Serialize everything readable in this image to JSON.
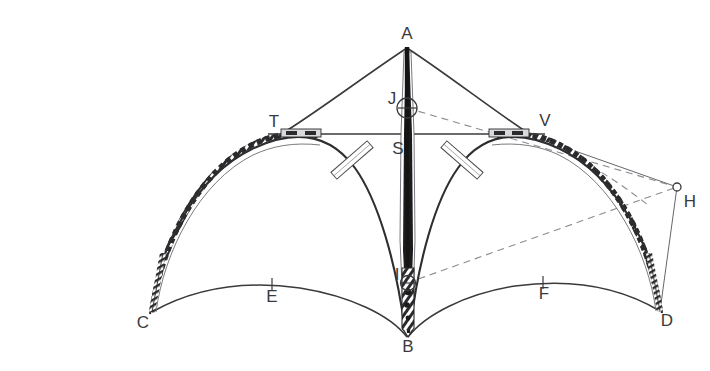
{
  "caption": {
    "number": "113",
    "text": "Lucy Edward's Black Bird construction diagram"
  },
  "figure": {
    "title": "Black Bird construction diagram",
    "colors": {
      "ink": "#3a3a3c",
      "mast": "#1c1c1c",
      "thin": "#55555a",
      "dashed": "#7c7c82",
      "background": "#ffffff"
    },
    "labels": [
      {
        "id": "A",
        "text": "A",
        "x": 407,
        "y": 39,
        "anchor": "middle",
        "note": "apex of mast"
      },
      {
        "id": "J",
        "text": "J",
        "x": 392,
        "y": 104,
        "anchor": "middle",
        "note": "upper node ring"
      },
      {
        "id": "T",
        "text": "T",
        "x": 274,
        "y": 127,
        "anchor": "middle",
        "note": "left spreader end"
      },
      {
        "id": "V",
        "text": "V",
        "x": 545,
        "y": 126,
        "anchor": "middle",
        "note": "right spreader end"
      },
      {
        "id": "S",
        "text": "S",
        "x": 398,
        "y": 154,
        "anchor": "middle",
        "note": "mast / spreader crossing"
      },
      {
        "id": "H",
        "text": "H",
        "x": 690,
        "y": 207,
        "anchor": "middle",
        "note": "anchor point right"
      },
      {
        "id": "I",
        "text": "I",
        "x": 397,
        "y": 280,
        "anchor": "middle",
        "note": "lower node ring"
      },
      {
        "id": "E",
        "text": "E",
        "x": 272,
        "y": 302,
        "anchor": "middle",
        "note": "left lower arc tick"
      },
      {
        "id": "F",
        "text": "F",
        "x": 544,
        "y": 299,
        "anchor": "middle",
        "note": "right lower arc tick"
      },
      {
        "id": "C",
        "text": "C",
        "x": 143,
        "y": 328,
        "anchor": "middle",
        "note": "left ground point"
      },
      {
        "id": "D",
        "text": "D",
        "x": 667,
        "y": 326,
        "anchor": "middle",
        "note": "right ground point"
      },
      {
        "id": "B",
        "text": "B",
        "x": 408,
        "y": 352,
        "anchor": "middle",
        "note": "mast foot"
      }
    ],
    "points": {
      "A": [
        407,
        47
      ],
      "J": [
        407,
        108
      ],
      "T": [
        282,
        134
      ],
      "V": [
        527,
        134
      ],
      "S": [
        407,
        134
      ],
      "H": [
        677,
        187
      ],
      "I": [
        407,
        283
      ],
      "B": [
        408,
        337
      ],
      "C": [
        152,
        312
      ],
      "D": [
        660,
        311
      ],
      "E": [
        272,
        287
      ],
      "F": [
        543,
        285
      ]
    }
  }
}
